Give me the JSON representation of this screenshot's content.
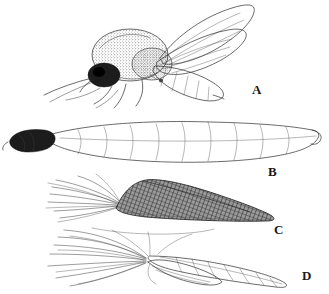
{
  "plate": {
    "title": "Insect life-stage plate",
    "background_color": "#ffffff",
    "ink_color": "#2b2b2b",
    "style": "black-and-white stipple and line engraving",
    "panel_count": 4
  },
  "panels": [
    {
      "key": "A",
      "label": "A",
      "subject": "adult fly",
      "description": "Adult midge in lateral view, wings held up and back over segmented abdomen, stippled hairy thorax, dark head with legs and antennae extending forward and down",
      "label_x": 252,
      "label_y": 88,
      "parts": [
        "wing",
        "thorax",
        "head",
        "abdomen",
        "legs",
        "antenna",
        "halteres"
      ]
    },
    {
      "key": "B",
      "label": "B",
      "subject": "larva",
      "description": "Elongate worm-like larva in lateral view with dark sclerotised head capsule at left and faintly segmented body tapering to the right",
      "label_x": 268,
      "label_y": 165,
      "parts": [
        "head-capsule",
        "body-segments",
        "posterior-end"
      ]
    },
    {
      "key": "C",
      "label": "C",
      "subject": "pupa cross-hatched",
      "description": "Dark cross-hatched wedge-shaped pupal case tapering to the right with a fan of feathery plume bristles radiating up and to the left",
      "label_x": 274,
      "label_y": 222,
      "parts": [
        "plume-bristles",
        "hatched-body",
        "taper"
      ]
    },
    {
      "key": "D",
      "label": "D",
      "subject": "pupa outline",
      "description": "Outline pupa with long radiating plume hairs converging at left, overlapping wing pads below and a ringed segmented abdomen tapering to the right",
      "label_x": 302,
      "label_y": 270,
      "parts": [
        "plume-hairs",
        "wing-pads",
        "segmented-abdomen"
      ]
    }
  ]
}
